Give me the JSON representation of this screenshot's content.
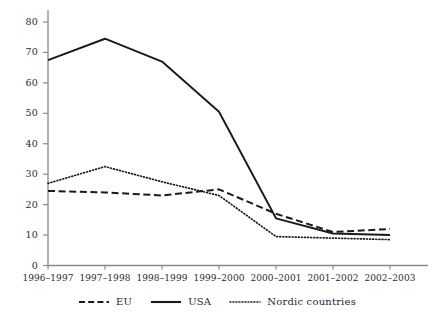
{
  "chart_data": {
    "type": "line",
    "title": "",
    "subtitle": "",
    "xlabel": "",
    "ylabel": "",
    "categories": [
      "1996–1997",
      "1997–1998",
      "1998–1999",
      "1999–2000",
      "2000–2001",
      "2001–2002",
      "2002–2003"
    ],
    "ylim": [
      0,
      80
    ],
    "yticks": [
      0,
      10,
      20,
      30,
      40,
      50,
      60,
      70,
      80
    ],
    "ytick_labels": [
      "0",
      "10",
      "20",
      "30",
      "40",
      "50",
      "60",
      "70",
      "80"
    ],
    "grid": false,
    "legend_position": "bottom",
    "series": [
      {
        "name": "EU",
        "style": "dashed",
        "color": "#1a1a1a",
        "values": [
          24.5,
          24,
          23,
          25,
          17,
          11,
          12
        ]
      },
      {
        "name": "USA",
        "style": "solid",
        "color": "#1a1a1a",
        "values": [
          67.5,
          74.5,
          67,
          50.5,
          15.5,
          10.5,
          10
        ]
      },
      {
        "name": "Nordic countries",
        "style": "dotted",
        "color": "#1a1a1a",
        "values": [
          27,
          32.5,
          27.5,
          23,
          9.5,
          9,
          8.5
        ]
      }
    ]
  },
  "axis": {
    "y_labels": [
      "80",
      "70",
      "60",
      "50",
      "40",
      "30",
      "20",
      "10",
      "0"
    ],
    "x_labels": [
      "1996–1997",
      "1997–1998",
      "1998–1999",
      "1999–2000",
      "2000–2001",
      "2001–2002",
      "2002–2003"
    ]
  },
  "legend": {
    "items": [
      {
        "label": "EU",
        "style": "dashed"
      },
      {
        "label": "USA",
        "style": "solid"
      },
      {
        "label": "Nordic countries",
        "style": "dotted"
      }
    ]
  }
}
